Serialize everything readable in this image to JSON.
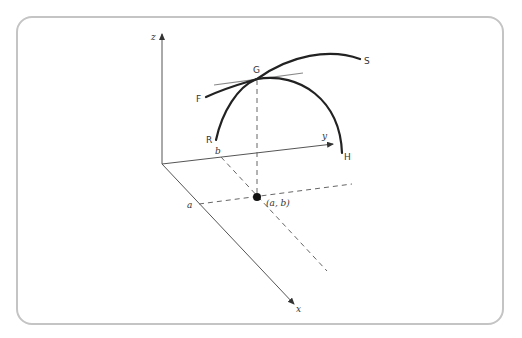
{
  "diagram": {
    "type": "3d-surface-curves",
    "axes": {
      "x": {
        "label": "x"
      },
      "y": {
        "label": "y"
      },
      "z": {
        "label": "z"
      }
    },
    "points": {
      "a": {
        "label": "a"
      },
      "b": {
        "label": "b"
      },
      "ab": {
        "label": "(a, b)"
      }
    },
    "curves": {
      "F": {
        "label": "F"
      },
      "S": {
        "label": "S"
      },
      "R": {
        "label": "R"
      },
      "H": {
        "label": "H"
      }
    },
    "intersection": {
      "label": "G"
    },
    "colors": {
      "axis": "#555555",
      "curve": "#222222",
      "tangent": "#888888",
      "dashed": "#666666",
      "frame": "#c4c4c4"
    }
  }
}
